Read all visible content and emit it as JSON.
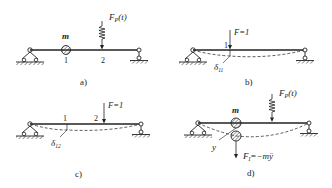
{
  "panels": {
    "a": {
      "caption": "a)",
      "mass_label": "m",
      "point1": "1",
      "point2": "2",
      "force_label_main": "F",
      "force_label_sub": "P",
      "force_label_arg": "(t)"
    },
    "b": {
      "caption": "b)",
      "force_label": "F=1",
      "point1": "1",
      "delta_main": "δ",
      "delta_sub": "11"
    },
    "c": {
      "caption": "c)",
      "force_label": "F=1",
      "point1": "1",
      "point2": "2",
      "delta_main": "δ",
      "delta_sub": "12"
    },
    "d": {
      "caption": "d)",
      "mass_label": "m",
      "force_label_main": "F",
      "force_label_sub": "P",
      "force_label_arg": "(t)",
      "displacement_label": "y",
      "inertia_main": "F",
      "inertia_sub": "I",
      "inertia_rhs": "=−mÿ"
    }
  },
  "colors": {
    "line": "#222222",
    "hatch": "#444444",
    "background": "#ffffff"
  }
}
